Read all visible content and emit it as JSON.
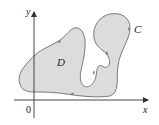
{
  "diagram": {
    "type": "planar-region-with-boundary-curve",
    "axes": {
      "x_label": "x",
      "y_label": "y",
      "origin_label": "0"
    },
    "region": {
      "label": "D",
      "fill_color": "#dcdcdc"
    },
    "boundary": {
      "label": "C",
      "stroke_color": "#7a7a7a",
      "orientation": "counterclockwise",
      "arrow_count": 5
    },
    "axis_color": "#333333"
  }
}
